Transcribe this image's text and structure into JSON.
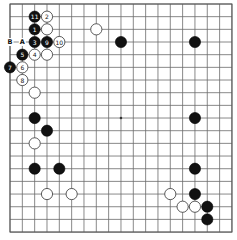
{
  "board": {
    "size": 19,
    "origin_x": 10,
    "origin_y": 4,
    "step_x": 12.33,
    "step_y": 12.67,
    "stone_radius": 5.6,
    "colors": {
      "black": "#111111",
      "white": "#ffffff",
      "grid": "#6b6b6b"
    },
    "hoshi": [
      [
        9,
        9
      ]
    ],
    "stones": [
      {
        "col": 2,
        "row": 1,
        "color": "black",
        "label": "11"
      },
      {
        "col": 3,
        "row": 1,
        "color": "white",
        "label": "2"
      },
      {
        "col": 2,
        "row": 2,
        "color": "black",
        "label": "1"
      },
      {
        "col": 3,
        "row": 2,
        "color": "white",
        "label": ""
      },
      {
        "col": 2,
        "row": 3,
        "color": "black",
        "label": "3"
      },
      {
        "col": 3,
        "row": 3,
        "color": "black",
        "label": "9"
      },
      {
        "col": 4,
        "row": 3,
        "color": "white",
        "label": "10"
      },
      {
        "col": 1,
        "row": 4,
        "color": "black",
        "label": "5"
      },
      {
        "col": 2,
        "row": 4,
        "color": "white",
        "label": "4"
      },
      {
        "col": 3,
        "row": 4,
        "color": "white",
        "label": ""
      },
      {
        "col": 0,
        "row": 5,
        "color": "black",
        "label": "7"
      },
      {
        "col": 1,
        "row": 5,
        "color": "white",
        "label": "6"
      },
      {
        "col": 1,
        "row": 6,
        "color": "white",
        "label": "8"
      },
      {
        "col": 2,
        "row": 7,
        "color": "white",
        "label": ""
      },
      {
        "col": 7,
        "row": 2,
        "color": "white",
        "label": ""
      },
      {
        "col": 9,
        "row": 3,
        "color": "black",
        "label": ""
      },
      {
        "col": 15,
        "row": 3,
        "color": "black",
        "label": ""
      },
      {
        "col": 2,
        "row": 9,
        "color": "black",
        "label": ""
      },
      {
        "col": 3,
        "row": 10,
        "color": "black",
        "label": ""
      },
      {
        "col": 2,
        "row": 11,
        "color": "white",
        "label": ""
      },
      {
        "col": 2,
        "row": 13,
        "color": "black",
        "label": ""
      },
      {
        "col": 4,
        "row": 13,
        "color": "black",
        "label": ""
      },
      {
        "col": 3,
        "row": 15,
        "color": "white",
        "label": ""
      },
      {
        "col": 5,
        "row": 15,
        "color": "white",
        "label": ""
      },
      {
        "col": 15,
        "row": 9,
        "color": "black",
        "label": ""
      },
      {
        "col": 15,
        "row": 13,
        "color": "black",
        "label": ""
      },
      {
        "col": 13,
        "row": 15,
        "color": "white",
        "label": ""
      },
      {
        "col": 15,
        "row": 15,
        "color": "black",
        "label": ""
      },
      {
        "col": 14,
        "row": 16,
        "color": "white",
        "label": ""
      },
      {
        "col": 15,
        "row": 16,
        "color": "white",
        "label": ""
      },
      {
        "col": 16,
        "row": 16,
        "color": "black",
        "label": ""
      },
      {
        "col": 16,
        "row": 17,
        "color": "black",
        "label": ""
      }
    ],
    "markers": [
      {
        "col": 0,
        "row": 3,
        "label": "B"
      },
      {
        "col": 1,
        "row": 3,
        "label": "A"
      }
    ]
  }
}
